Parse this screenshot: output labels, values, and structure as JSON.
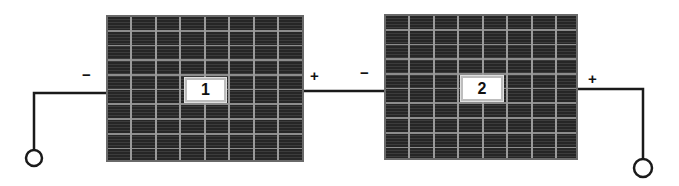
{
  "diagram": {
    "title": "",
    "panels": [
      {
        "id": "panel-1",
        "label": "1",
        "negative_sign": "−",
        "positive_sign": "+"
      },
      {
        "id": "panel-2",
        "label": "2",
        "negative_sign": "−",
        "positive_sign": "+"
      }
    ],
    "terminals": [
      {
        "id": "terminal-negative",
        "icon": "open-circle-terminal"
      },
      {
        "id": "terminal-positive",
        "icon": "open-circle-terminal"
      }
    ],
    "colors": {
      "panel_fill": "#1c1c1c",
      "panel_grid": "#9a9a9a",
      "wire": "#1a1a1a",
      "label_bg": "#ffffff"
    },
    "grid": {
      "columns": 8,
      "rows": 10
    }
  }
}
